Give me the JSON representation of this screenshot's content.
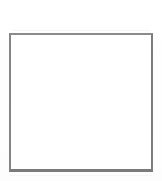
{
  "page": {
    "title": "",
    "background_color": "#ffffff",
    "width": 162,
    "height": 181
  },
  "frame": {
    "label": "",
    "interior_text": "",
    "border_color": "#828282",
    "fill_color": "#ffffff",
    "border_width_px": 2,
    "left_px": 9,
    "top_px": 33,
    "width_px": 144,
    "height_px": 139
  },
  "artifacts": {
    "top_edge": "",
    "bottom_edge": ""
  }
}
